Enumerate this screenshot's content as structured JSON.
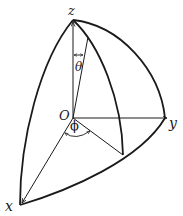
{
  "diagram": {
    "labels": {
      "z": "z",
      "y": "y",
      "x": "x",
      "origin": "O",
      "theta": "θ",
      "phi": "ϕ"
    },
    "colors": {
      "stroke": "#1a1a1a",
      "background": "#ffffff"
    }
  }
}
